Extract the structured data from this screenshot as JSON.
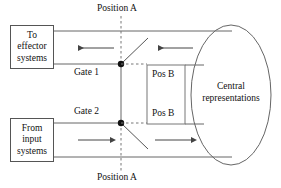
{
  "diagram": {
    "colors": {
      "stroke": "#555555",
      "text": "#111111",
      "background": "#ffffff",
      "dashed": "#555555"
    },
    "boxes": [
      {
        "id": "effector",
        "lines": [
          "To",
          "effector",
          "systems"
        ]
      },
      {
        "id": "input",
        "lines": [
          "From",
          "input",
          "systems"
        ]
      }
    ],
    "labels": {
      "position_a_top": "Position A",
      "position_a_bottom": "Position A",
      "gate_1": "Gate 1",
      "gate_2": "Gate 2",
      "pos_b_top": "Pos B",
      "pos_b_bottom": "Pos B",
      "central": "Central representations"
    },
    "box_text": {
      "effector_line1": "To",
      "effector_line2": "effector",
      "effector_line3": "systems",
      "input_line1": "From",
      "input_line2": "input",
      "input_line3": "systems"
    },
    "flow": {
      "top_arrow_direction": "left",
      "top_inner_arrow_direction": "left",
      "bottom_arrow_direction": "right",
      "bottom_inner_arrow_direction": "right"
    }
  }
}
